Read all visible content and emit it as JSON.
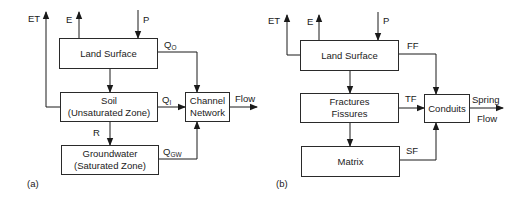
{
  "panels": {
    "a": {
      "tag": "(a)",
      "boxes": {
        "land_surface": "Land Surface",
        "soil_line1": "Soil",
        "soil_line2": "(Unsaturated Zone)",
        "groundwater_line1": "Groundwater",
        "groundwater_line2": "(Saturated Zone)",
        "channel_line1": "Channel",
        "channel_line2": "Network"
      },
      "labels": {
        "et": "ET",
        "e": "E",
        "p": "P",
        "qo_main": "Q",
        "qo_sub": "O",
        "qi_main": "Q",
        "qi_sub": "I",
        "qgw_main": "Q",
        "qgw_sub": "GW",
        "r": "R",
        "flow": "Flow"
      }
    },
    "b": {
      "tag": "(b)",
      "boxes": {
        "land_surface": "Land Surface",
        "fractures_line1": "Fractures",
        "fractures_line2": "Fissures",
        "matrix": "Matrix",
        "conduits": "Conduits"
      },
      "labels": {
        "et": "ET",
        "e": "E",
        "p": "P",
        "ff": "FF",
        "tf": "TF",
        "sf": "SF",
        "spring": "Spring",
        "flow": "Flow"
      }
    }
  },
  "colors": {
    "line": "#1a1a1a",
    "background": "#ffffff"
  }
}
